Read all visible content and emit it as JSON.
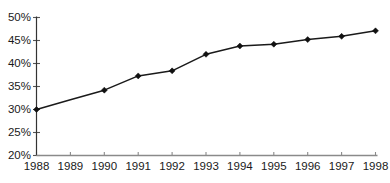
{
  "chart_data": {
    "type": "line",
    "title": "",
    "subtitle": "",
    "xlabel": "",
    "ylabel": "",
    "categories": [
      "1988",
      "1989",
      "1990",
      "1991",
      "1992",
      "1993",
      "1994",
      "1995",
      "1996",
      "1997",
      "1998"
    ],
    "x": [
      1988,
      1989,
      1990,
      1991,
      1992,
      1993,
      1994,
      1995,
      1996,
      1997,
      1998
    ],
    "values": [
      30.0,
      32.1,
      34.2,
      37.3,
      38.4,
      42.0,
      43.8,
      44.2,
      45.2,
      45.9,
      47.1
    ],
    "markers": [
      true,
      false,
      true,
      true,
      true,
      true,
      true,
      true,
      true,
      true,
      true
    ],
    "ylim": [
      20,
      50
    ],
    "xlim": [
      1988,
      1998
    ],
    "yticks": [
      20,
      25,
      30,
      35,
      40,
      45,
      50
    ],
    "ytick_labels": [
      "20%",
      "25%",
      "30%",
      "35%",
      "40%",
      "45%",
      "50%"
    ],
    "xtick_labels": [
      "1988",
      "1989",
      "1990",
      "1991",
      "1992",
      "1993",
      "1994",
      "1995",
      "1996",
      "1997",
      "1998"
    ],
    "grid": false,
    "legend": null,
    "legend_position": "none",
    "annotations": [],
    "series": [
      {
        "name": "",
        "values": [
          30.0,
          32.1,
          34.2,
          37.3,
          38.4,
          42.0,
          43.8,
          44.2,
          45.2,
          45.9,
          47.1
        ],
        "line_color": "#1a1a1a",
        "marker_color": "#111111",
        "marker_shape": "diamond"
      }
    ],
    "colors": {
      "line": "#1a1a1a",
      "marker": "#111111",
      "y_axis": "#333333",
      "x_axis": "#8a8a8a",
      "tick_label": "#1a1a1a",
      "background": "#ffffff"
    }
  }
}
